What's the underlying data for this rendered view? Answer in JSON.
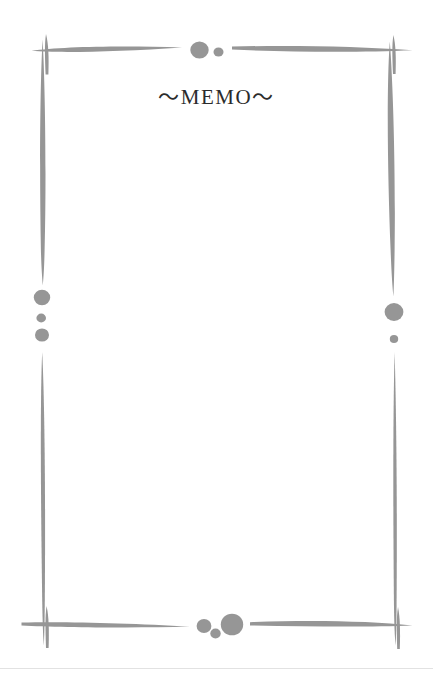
{
  "page": {
    "width": 433,
    "height": 677,
    "background_color": "#ffffff",
    "title_text": "～MEMO～",
    "title_color": "#2b2b2b",
    "ornament_color": "#969696",
    "edge_line_color": "#e2e2e2"
  },
  "frame": {
    "description": "hand-drawn brush-stroke rectangular border with dot accents",
    "strokes": [
      {
        "name": "top-left-horizontal-stroke",
        "from_x": 32,
        "to_x": 182,
        "y": 50
      },
      {
        "name": "top-right-horizontal-stroke",
        "from_x": 232,
        "to_x": 412,
        "y": 50
      },
      {
        "name": "left-upper-vertical-stroke",
        "from_y": 40,
        "to_y": 285,
        "x": 44
      },
      {
        "name": "left-lower-vertical-stroke",
        "from_y": 352,
        "to_y": 645,
        "x": 42
      },
      {
        "name": "right-upper-vertical-stroke",
        "from_y": 42,
        "to_y": 296,
        "x": 392
      },
      {
        "name": "right-lower-vertical-stroke",
        "from_y": 352,
        "to_y": 645,
        "x": 396
      },
      {
        "name": "bottom-left-horizontal-stroke",
        "from_x": 22,
        "to_x": 190,
        "y": 626
      },
      {
        "name": "bottom-right-horizontal-stroke",
        "from_x": 250,
        "to_x": 412,
        "y": 626
      }
    ],
    "corner_marks": [
      {
        "name": "top-left-cross",
        "x": 47,
        "y": 50
      },
      {
        "name": "top-right-cross",
        "x": 394,
        "y": 50
      },
      {
        "name": "bottom-left-cross",
        "x": 47,
        "y": 626
      },
      {
        "name": "bottom-right-cross",
        "x": 398,
        "y": 626
      }
    ],
    "dots": [
      {
        "name": "top-dot-large",
        "cx": 199,
        "cy": 50,
        "r": 9
      },
      {
        "name": "top-dot-small",
        "cx": 218,
        "cy": 52,
        "r": 5
      },
      {
        "name": "left-dot-large",
        "cx": 42,
        "cy": 297,
        "r": 8
      },
      {
        "name": "left-dot-small",
        "cx": 41,
        "cy": 318,
        "r": 5
      },
      {
        "name": "left-dot-medium",
        "cx": 42,
        "cy": 335,
        "r": 7
      },
      {
        "name": "right-dot-large",
        "cx": 394,
        "cy": 312,
        "r": 9
      },
      {
        "name": "right-dot-small",
        "cx": 394,
        "cy": 339,
        "r": 4
      },
      {
        "name": "bottom-dot-medium",
        "cx": 204,
        "cy": 626,
        "r": 7
      },
      {
        "name": "bottom-dot-small",
        "cx": 215,
        "cy": 633,
        "r": 5
      },
      {
        "name": "bottom-dot-large",
        "cx": 232,
        "cy": 624,
        "r": 11
      }
    ]
  }
}
